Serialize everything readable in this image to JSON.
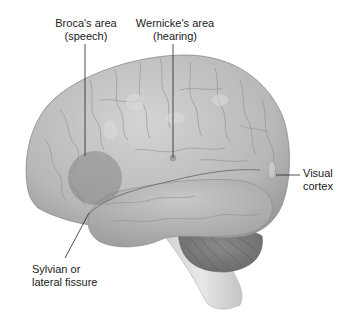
{
  "figure": {
    "labels": [
      {
        "id": "broca",
        "line1": "Broca's area",
        "line2": "(speech)"
      },
      {
        "id": "wernicke",
        "line1": "Wernicke's area",
        "line2": "(hearing)"
      },
      {
        "id": "visual",
        "line1": "Visual",
        "line2": "cortex"
      },
      {
        "id": "sylvian",
        "line1": "Sylvian or",
        "line2": "lateral fissure"
      }
    ]
  },
  "colors": {
    "background": "#ffffff",
    "cortex": "#bdbdbd",
    "cortex_shadow": "#8f8f8f",
    "broca_highlight": "#8c8c8c",
    "cerebellum": "#7d7d7d",
    "brainstem": "#d9d9d9",
    "leader_line": "#222222",
    "text": "#1a1a1a"
  }
}
